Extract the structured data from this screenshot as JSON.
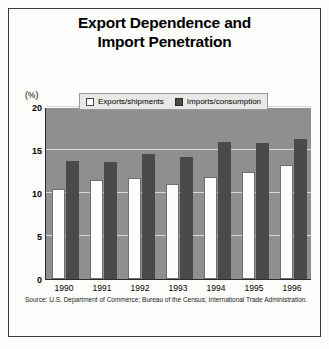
{
  "chart_data": {
    "type": "bar",
    "title": "Export Dependence and Import Penetration",
    "title_lines": [
      "Export Dependence and",
      "Import Penetration"
    ],
    "xlabel": "",
    "ylabel": "(%)",
    "ylim": [
      0,
      20
    ],
    "yticks": [
      20,
      15,
      10,
      5,
      0
    ],
    "grid": true,
    "legend_position": "top-center",
    "categories": [
      "1990",
      "1991",
      "1992",
      "1993",
      "1994",
      "1995",
      "1996"
    ],
    "series": [
      {
        "name": "Exports/shipments",
        "color": "#ffffff",
        "values": [
          10.5,
          11.5,
          11.7,
          11.0,
          11.9,
          12.5,
          13.3
        ]
      },
      {
        "name": "Imports/consumption",
        "color": "#4a4a4a",
        "values": [
          13.7,
          13.6,
          14.5,
          14.2,
          15.9,
          15.8,
          16.3
        ]
      }
    ],
    "source": "Source: U.S. Department of Commerce; Bureau of the Census; International Trade Administration.",
    "plot_background": "#8f8f8f"
  }
}
